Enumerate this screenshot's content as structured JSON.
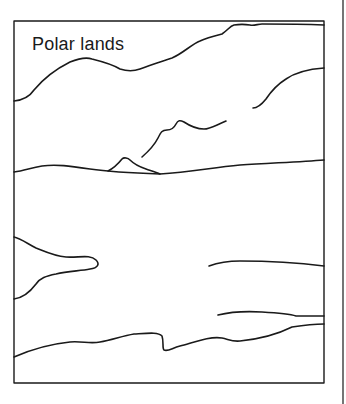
{
  "diagram": {
    "title": "Polar lands",
    "stroke_color": "#1a1a1a",
    "background": "#ffffff"
  }
}
